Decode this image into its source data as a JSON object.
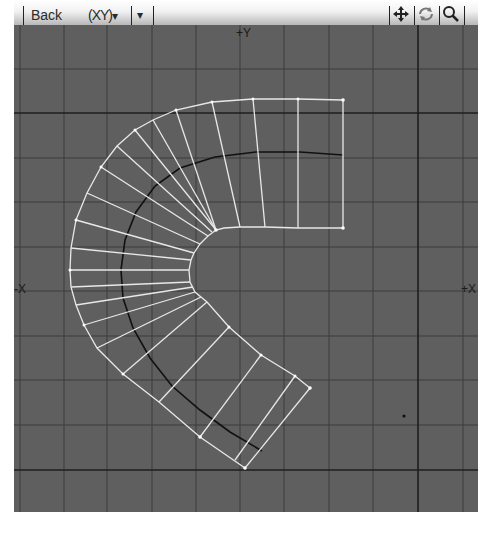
{
  "toolbar": {
    "view_name": "Back",
    "view_mode": "(XY)",
    "view_mode_arrow": "▾",
    "extra_dropdown_arrow": "▾",
    "icons": [
      "move-icon",
      "rotate-icon",
      "zoom-icon"
    ]
  },
  "viewport": {
    "background_color": "#5f5f5f",
    "grid_color": "#3a3a3a",
    "axis_line_color": "#1e1e1e",
    "mesh_color": "#e8e8e8",
    "spline_color": "#111111",
    "labels": {
      "top_axis": "+Y",
      "left_axis": "-X",
      "right_axis": "+X"
    }
  }
}
